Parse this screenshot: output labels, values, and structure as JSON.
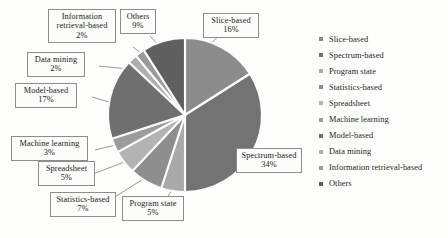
{
  "chart_data": {
    "type": "pie",
    "title": "",
    "subtitle": "",
    "xlabel": "",
    "ylabel": "",
    "grid": false,
    "legend_position": "right",
    "units": "percent",
    "total": 100,
    "categories": [
      "Slice-based",
      "Spectrum-based",
      "Program state",
      "Statistics-based",
      "Spreadsheet",
      "Machine learning",
      "Model-based",
      "Data mining",
      "Information retrieval-based",
      "Others"
    ],
    "values": [
      16,
      34,
      5,
      7,
      5,
      3,
      17,
      2,
      2,
      9
    ],
    "value_labels": [
      "16%",
      "34%",
      "5%",
      "7%",
      "5%",
      "3%",
      "17%",
      "2%",
      "2%",
      "9%"
    ],
    "colors": [
      "#8c8c8c",
      "#737373",
      "#a9a9a9",
      "#8e8e8e",
      "#b3b3b3",
      "#9c9c9c",
      "#6f6f6f",
      "#aeaeae",
      "#9a9a9a",
      "#5f5f5f"
    ],
    "slices": [
      {
        "name": "Slice-based",
        "value": 16,
        "label": "Slice-based",
        "pct": "16%",
        "color": "#8c8c8c"
      },
      {
        "name": "Spectrum-based",
        "value": 34,
        "label": "Spectrum-based",
        "pct": "34%",
        "color": "#737373"
      },
      {
        "name": "Program state",
        "value": 5,
        "label": "Program state",
        "pct": "5%",
        "color": "#a9a9a9"
      },
      {
        "name": "Statistics-based",
        "value": 7,
        "label": "Statistics-based",
        "pct": "7%",
        "color": "#8e8e8e"
      },
      {
        "name": "Spreadsheet",
        "value": 5,
        "label": "Spreadsheet",
        "pct": "5%",
        "color": "#b3b3b3"
      },
      {
        "name": "Machine learning",
        "value": 3,
        "label": "Machine learning",
        "pct": "3%",
        "color": "#9c9c9c"
      },
      {
        "name": "Model-based",
        "value": 17,
        "label": "Model-based",
        "pct": "17%",
        "color": "#6f6f6f"
      },
      {
        "name": "Data mining",
        "value": 2,
        "label": "Data mining",
        "pct": "2%",
        "color": "#aeaeae"
      },
      {
        "name": "Information retrieval-based",
        "value": 2,
        "label": "Information retrieval-based",
        "pct": "2%",
        "color": "#9a9a9a"
      },
      {
        "name": "Others",
        "value": 9,
        "label": "Others",
        "pct": "9%",
        "color": "#5f5f5f"
      }
    ]
  },
  "callouts": {
    "information_retrieval": {
      "line1": "Information",
      "line2": "retrieval-based",
      "pct": "2%"
    },
    "others": {
      "line1": "Others",
      "pct": "9%"
    },
    "slice_based": {
      "line1": "Slice-based",
      "pct": "16%"
    },
    "data_mining": {
      "line1": "Data mining",
      "pct": "2%"
    },
    "model_based": {
      "line1": "Model-based",
      "pct": "17%"
    },
    "machine_learning": {
      "line1": "Machine learning",
      "pct": "3%"
    },
    "spreadsheet": {
      "line1": "Spreadsheet",
      "pct": "5%"
    },
    "statistics_based": {
      "line1": "Statistics-based",
      "pct": "7%"
    },
    "program_state": {
      "line1": "Program state",
      "pct": "5%"
    },
    "spectrum_based": {
      "line1": "Spectrum-based",
      "pct": "34%"
    }
  },
  "legend": {
    "items": [
      {
        "label": "Slice-based",
        "color": "#8c8c8c"
      },
      {
        "label": "Spectrum-based",
        "color": "#737373"
      },
      {
        "label": "Program state",
        "color": "#a9a9a9"
      },
      {
        "label": "Statistics-based",
        "color": "#8e8e8e"
      },
      {
        "label": "Spreadsheet",
        "color": "#b3b3b3"
      },
      {
        "label": "Machine learning",
        "color": "#9c9c9c"
      },
      {
        "label": "Model-based",
        "color": "#6f6f6f"
      },
      {
        "label": "Data mining",
        "color": "#aeaeae"
      },
      {
        "label": "Information retrieval-based",
        "color": "#9a9a9a"
      },
      {
        "label": "Others",
        "color": "#5f5f5f"
      }
    ]
  }
}
